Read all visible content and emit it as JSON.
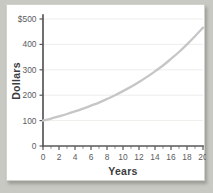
{
  "chart_data": {
    "type": "line",
    "title": "",
    "xlabel": "Years",
    "ylabel": "Dollars",
    "xlim": [
      0,
      20
    ],
    "ylim": [
      0,
      500
    ],
    "grid": true,
    "legend": false,
    "x_ticks": [
      0,
      2,
      4,
      6,
      8,
      10,
      12,
      14,
      16,
      18,
      20
    ],
    "x_tick_labels": [
      "0",
      "2",
      "4",
      "6",
      "8",
      "10",
      "12",
      "14",
      "16",
      "18",
      "20"
    ],
    "x_minor_ticks": [
      1,
      3,
      5,
      7,
      9,
      11,
      13,
      15,
      17,
      19
    ],
    "y_ticks": [
      0,
      100,
      200,
      300,
      400,
      500
    ],
    "y_tick_labels": [
      "0",
      "100",
      "200",
      "300",
      "400",
      "$500"
    ],
    "series": [
      {
        "name": "Compound growth",
        "color": "#c6c6c6",
        "x": [
          0,
          1,
          2,
          3,
          4,
          5,
          6,
          7,
          8,
          9,
          10,
          11,
          12,
          13,
          14,
          15,
          16,
          17,
          18,
          19,
          20
        ],
        "values": [
          100,
          108,
          117,
          126,
          136,
          147,
          159,
          171,
          185,
          200,
          216,
          233,
          252,
          272,
          294,
          317,
          343,
          370,
          400,
          432,
          466
        ]
      }
    ]
  },
  "axes": {
    "y_title": "Dollars",
    "x_title": "Years"
  },
  "ticks": {
    "y": [
      "$500",
      "400",
      "300",
      "200",
      "100",
      "0"
    ],
    "x": [
      "0",
      "2",
      "4",
      "6",
      "8",
      "10",
      "12",
      "14",
      "16",
      "18",
      "20"
    ]
  }
}
